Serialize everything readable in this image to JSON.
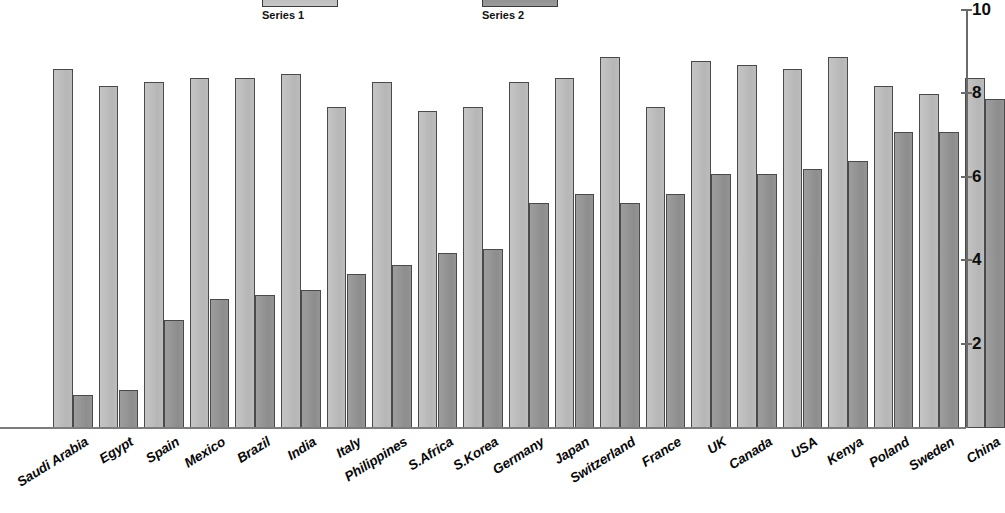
{
  "chart_data": {
    "type": "bar",
    "title": "",
    "subtitle": "",
    "xlabel": "",
    "ylabel": "",
    "ylim": [
      0,
      10
    ],
    "grid": false,
    "legend_position": "top",
    "y_ticks": [
      {
        "label": "10",
        "value": 10
      },
      {
        "label": "8",
        "value": 8
      },
      {
        "label": "6",
        "value": 6
      },
      {
        "label": "4",
        "value": 4
      },
      {
        "label": "2",
        "value": 2
      }
    ],
    "categories": [
      "Saudi Arabia",
      "Egypt",
      "Spain",
      "Mexico",
      "Brazil",
      "India",
      "Italy",
      "Philippines",
      "S.Africa",
      "S.Korea",
      "Germany",
      "Japan",
      "Switzerland",
      "France",
      "UK",
      "Canada",
      "USA",
      "Kenya",
      "Poland",
      "Sweden",
      "China"
    ],
    "series": [
      {
        "name": "Series 1",
        "color": "#bdbdbd",
        "values": [
          8.6,
          8.2,
          8.3,
          8.4,
          8.4,
          8.5,
          7.7,
          8.3,
          7.6,
          7.7,
          8.3,
          8.4,
          8.9,
          7.7,
          8.8,
          8.7,
          8.6,
          8.9,
          8.2,
          8.0,
          8.4
        ]
      },
      {
        "name": "Series 2",
        "color": "#949494",
        "values": [
          0.8,
          0.9,
          2.6,
          3.1,
          3.2,
          3.3,
          3.7,
          3.9,
          4.2,
          4.3,
          5.4,
          5.6,
          5.4,
          5.6,
          6.1,
          6.1,
          6.2,
          6.4,
          7.1,
          7.1,
          7.9
        ]
      }
    ]
  },
  "legend": {
    "entries": [
      {
        "label": "",
        "style": "light"
      },
      {
        "label": "",
        "style": "dark"
      }
    ]
  },
  "axis": {
    "max_label": "10"
  }
}
